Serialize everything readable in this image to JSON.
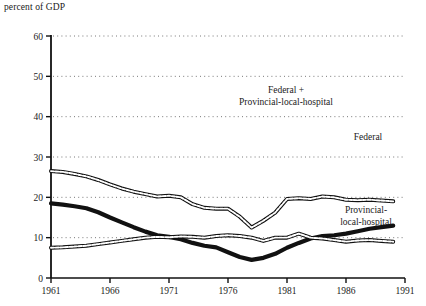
{
  "chart_data": {
    "type": "line",
    "title": "",
    "ylabel": "percent of GDP",
    "xlabel": "",
    "xlim": [
      1961,
      1991
    ],
    "ylim": [
      0,
      60
    ],
    "yticks": [
      0,
      10,
      20,
      30,
      40,
      50,
      60
    ],
    "xticks": [
      1961,
      1966,
      1971,
      1976,
      1981,
      1986,
      1991
    ],
    "grid": "horizontal-dotted",
    "legend_position": "inline-annotations",
    "x": [
      1961,
      1962,
      1963,
      1964,
      1965,
      1966,
      1967,
      1968,
      1969,
      1970,
      1971,
      1972,
      1973,
      1974,
      1975,
      1976,
      1977,
      1978,
      1979,
      1980,
      1981,
      1982,
      1983,
      1984,
      1985,
      1986,
      1987,
      1988,
      1989,
      1990
    ],
    "series": [
      {
        "name": "Federal + Provincial-local-hospital",
        "style": "outlined",
        "values": [
          26.5,
          26.3,
          25.8,
          25.2,
          24.3,
          23.2,
          22.2,
          21.4,
          20.8,
          20.2,
          20.4,
          20.0,
          18.3,
          17.4,
          17.2,
          17.2,
          15.2,
          12.5,
          14.2,
          16.2,
          19.6,
          19.8,
          19.6,
          20.2,
          20.0,
          19.4,
          19.3,
          19.4,
          19.2,
          19.0
        ]
      },
      {
        "name": "Federal",
        "style": "solid-thick",
        "values": [
          18.5,
          18.2,
          17.8,
          17.3,
          16.3,
          15.0,
          13.8,
          12.6,
          11.5,
          10.6,
          10.2,
          9.6,
          8.7,
          8.0,
          7.6,
          6.4,
          5.2,
          4.5,
          5.0,
          6.0,
          7.5,
          8.7,
          9.8,
          10.4,
          10.6,
          11.0,
          11.6,
          12.2,
          12.6,
          13.0
        ]
      },
      {
        "name": "Provincial-local-hospital",
        "style": "outlined",
        "values": [
          7.5,
          7.6,
          7.8,
          8.0,
          8.4,
          8.8,
          9.2,
          9.6,
          10.0,
          10.2,
          10.1,
          10.3,
          10.2,
          10.0,
          10.4,
          10.6,
          10.4,
          10.0,
          9.2,
          10.0,
          10.0,
          11.0,
          10.0,
          9.8,
          9.4,
          9.0,
          9.3,
          9.4,
          9.2,
          9.0
        ]
      }
    ],
    "annotations": [
      {
        "text_line1": "Federal +",
        "text_line2": "Provincial-local-hospital",
        "target": "total"
      },
      {
        "text_line1": "Federal",
        "text_line2": "",
        "target": "federal"
      },
      {
        "text_line1": "Provincial-",
        "text_line2": "local-hospital",
        "target": "provincial"
      }
    ],
    "colors": {
      "line": "#111111",
      "fill": "#ffffff",
      "axis": "#111111",
      "grid": "#555555",
      "background": "#ffffff"
    }
  }
}
